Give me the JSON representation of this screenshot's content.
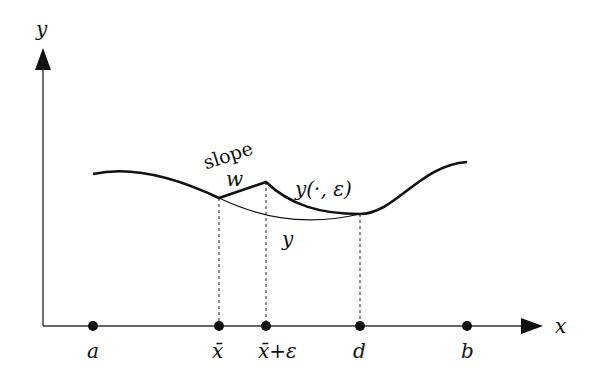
{
  "diagram": {
    "axes": {
      "x_label": "x",
      "y_label": "y"
    },
    "points": [
      {
        "id": "a",
        "label": "a",
        "x": 93
      },
      {
        "id": "xbar",
        "label": "x̄",
        "x": 219
      },
      {
        "id": "xbar-eps",
        "label": "x̄+ε",
        "x": 266
      },
      {
        "id": "d",
        "label": "d",
        "x": 360
      },
      {
        "id": "b",
        "label": "b",
        "x": 467
      }
    ],
    "curves": {
      "perturbed_label": "y(·, ε)",
      "original_label": "y"
    },
    "annotations": {
      "slope_word": "slope",
      "slope_value": "w"
    },
    "colors": {
      "stroke": "#111111",
      "background": "#ffffff"
    }
  }
}
